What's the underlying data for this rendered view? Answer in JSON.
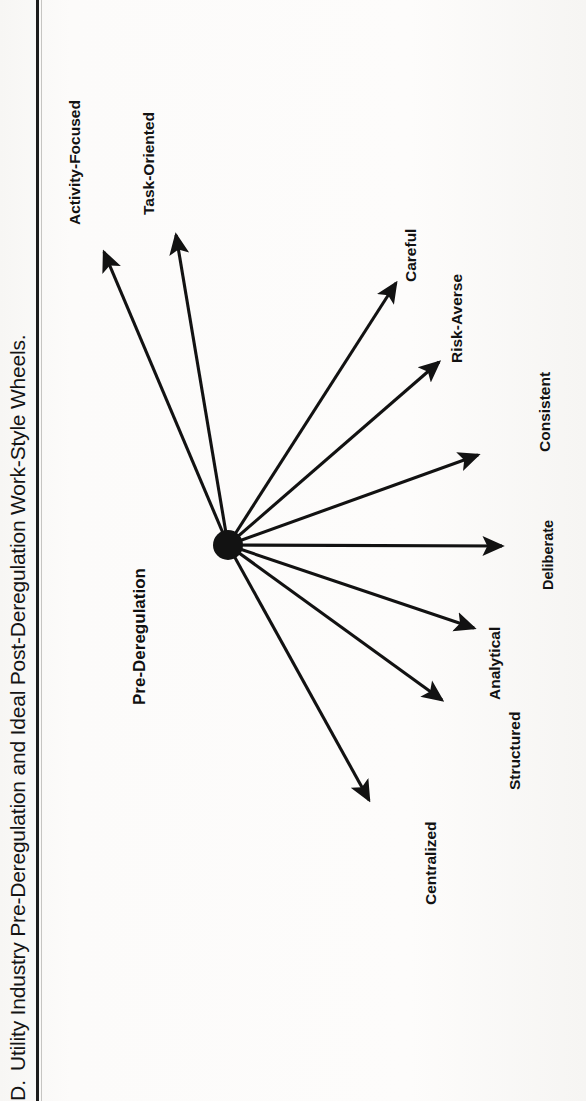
{
  "figure": {
    "number": "D.",
    "caption": "Utility Industry Pre-Deregulation and Ideal Post-Deregulation Work-Style Wheels.",
    "full_caption": "D. Utility Industry Pre-Deregulation and Ideal Post-Deregulation Work-Style Wheels."
  },
  "diagram": {
    "type": "radial-spoke-wheel",
    "heading": "Pre-Deregulation",
    "hub": {
      "name": "hub",
      "fill": "#111111"
    },
    "orientation": "rotated-90-ccw",
    "spokes": [
      {
        "label": "Activity-Focused"
      },
      {
        "label": "Task-Oriented"
      },
      {
        "label": "Careful"
      },
      {
        "label": "Risk-Averse"
      },
      {
        "label": "Consistent"
      },
      {
        "label": "Deliberate"
      },
      {
        "label": "Analytical"
      },
      {
        "label": "Structured"
      },
      {
        "label": "Centralized"
      }
    ]
  },
  "colors": {
    "ink": "#121212",
    "paper": "#fbfbfa",
    "rule": "#1c1c1c"
  }
}
